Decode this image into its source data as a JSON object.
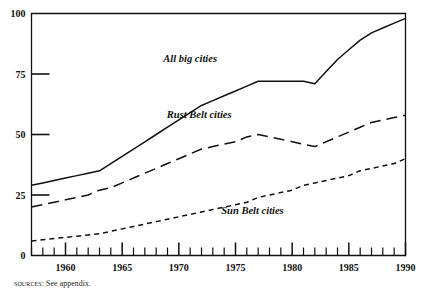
{
  "figure": {
    "source_note_kicker": "Sources:",
    "source_note_text": "See appendix."
  },
  "chart_data": {
    "type": "line",
    "title": "",
    "subtitle": "",
    "xlabel": "",
    "ylabel": "",
    "xlim": [
      1957,
      1990
    ],
    "ylim": [
      0,
      100
    ],
    "grid": false,
    "legend": "inline-annotations",
    "y_ticks": [
      0,
      25,
      50,
      75,
      100
    ],
    "y_tick_labels": [
      "0",
      "25",
      "50",
      "75",
      "100"
    ],
    "x_major_ticks": [
      1960,
      1965,
      1970,
      1975,
      1980,
      1985,
      1990
    ],
    "x_major_tick_labels": [
      "1960",
      "1965",
      "1970",
      "1975",
      "1980",
      "1985",
      "1990"
    ],
    "x_minor_tick_step": 1,
    "x": [
      1957,
      1958,
      1959,
      1960,
      1961,
      1962,
      1963,
      1964,
      1965,
      1966,
      1967,
      1968,
      1969,
      1970,
      1971,
      1972,
      1973,
      1974,
      1975,
      1976,
      1977,
      1978,
      1979,
      1980,
      1981,
      1982,
      1983,
      1984,
      1985,
      1986,
      1987,
      1988,
      1989,
      1990
    ],
    "series": [
      {
        "name": "All big cities",
        "style": "solid",
        "label_x": 1971.0,
        "label_y": 80.0,
        "values": [
          29,
          30,
          31,
          32,
          33,
          34,
          35,
          38,
          41,
          44,
          47,
          50,
          53,
          56,
          59,
          62,
          64,
          66,
          68,
          70,
          72,
          72,
          72,
          72,
          72,
          71,
          76,
          81,
          85,
          89,
          92,
          94,
          96,
          98
        ]
      },
      {
        "name": "Rust Belt cities",
        "style": "dashed",
        "label_x": 1971.8,
        "label_y": 57.0,
        "values": [
          20,
          21,
          22,
          23,
          24,
          25,
          27,
          28,
          30,
          32,
          34,
          36,
          38,
          40,
          42,
          44,
          45,
          46,
          47,
          49,
          50,
          49,
          48,
          47,
          46,
          45,
          47,
          49,
          51,
          53,
          55,
          56,
          57,
          58
        ]
      },
      {
        "name": "Sun Belt cities",
        "style": "dotted",
        "label_x": 1976.5,
        "label_y": 17.0,
        "values": [
          6,
          6.5,
          7,
          7.5,
          8,
          8.5,
          9,
          10,
          11,
          12,
          13,
          14,
          15,
          16,
          17,
          18,
          19,
          20,
          21,
          22,
          24,
          25,
          26,
          27,
          29,
          30,
          31,
          32,
          33,
          35,
          36,
          37,
          38,
          40
        ]
      }
    ]
  }
}
